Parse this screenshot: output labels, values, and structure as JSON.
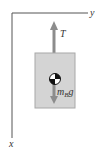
{
  "diagram": {
    "axes": {
      "horizontal_label": "y",
      "vertical_label": "x"
    },
    "forces": [
      {
        "name": "tension",
        "label": "T",
        "direction": "up"
      },
      {
        "name": "weight",
        "label_main": "m",
        "label_sub": "B",
        "label_tail": "g",
        "direction": "down"
      }
    ],
    "body": {
      "name": "block B",
      "has_center_of_mass_symbol": true
    },
    "colors": {
      "axis": "#555555",
      "body_fill": "#d4d4d4",
      "body_stroke": "#a8a8a8",
      "arrow": "#8c8c8c",
      "text": "#333333"
    }
  }
}
